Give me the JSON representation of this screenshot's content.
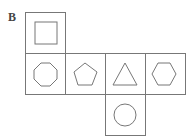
{
  "label": "B",
  "net": {
    "description": "Cube net with six faces",
    "faces": [
      {
        "shape": "square",
        "row": 0,
        "col": 0
      },
      {
        "shape": "octagon",
        "row": 1,
        "col": 0
      },
      {
        "shape": "pentagon",
        "row": 1,
        "col": 1
      },
      {
        "shape": "triangle",
        "row": 1,
        "col": 2
      },
      {
        "shape": "hexagon",
        "row": 1,
        "col": 3
      },
      {
        "shape": "circle",
        "row": 2,
        "col": 2
      }
    ]
  },
  "colors": {
    "stroke": "#777777",
    "background": "#ffffff"
  }
}
